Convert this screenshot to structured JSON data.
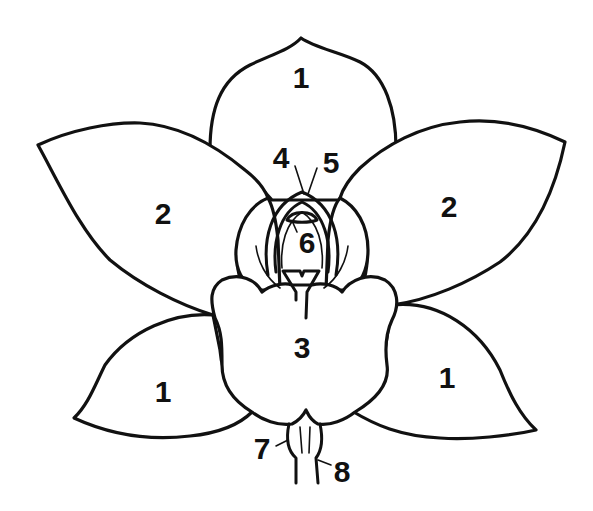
{
  "diagram": {
    "line_color": "#111111",
    "background": "#ffffff",
    "labels": [
      {
        "id": "sepal-top",
        "text": "1",
        "x": 301,
        "y": 78
      },
      {
        "id": "sepal-bottom-left",
        "text": "1",
        "x": 163,
        "y": 392
      },
      {
        "id": "sepal-bottom-right",
        "text": "1",
        "x": 447,
        "y": 378
      },
      {
        "id": "petal-left",
        "text": "2",
        "x": 163,
        "y": 214
      },
      {
        "id": "petal-right",
        "text": "2",
        "x": 449,
        "y": 207
      },
      {
        "id": "lip",
        "text": "3",
        "x": 302,
        "y": 348
      },
      {
        "id": "part-4",
        "text": "4",
        "x": 281,
        "y": 158
      },
      {
        "id": "part-5",
        "text": "5",
        "x": 331,
        "y": 163
      },
      {
        "id": "part-6",
        "text": "6",
        "x": 307,
        "y": 243
      },
      {
        "id": "part-7",
        "text": "7",
        "x": 262,
        "y": 449
      },
      {
        "id": "part-8",
        "text": "8",
        "x": 342,
        "y": 472
      }
    ]
  }
}
